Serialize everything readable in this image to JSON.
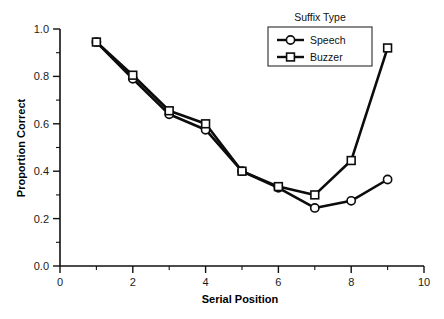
{
  "chart_data": {
    "type": "line",
    "title": "",
    "xlabel": "Serial Position",
    "ylabel": "Proportion Correct",
    "xlim": [
      0,
      10
    ],
    "ylim": [
      0,
      1.0
    ],
    "grid": false,
    "legend_title": "Suffix Type",
    "legend_position": "top-right",
    "x": [
      1,
      2,
      3,
      4,
      5,
      6,
      7,
      8,
      9
    ],
    "xticks": [
      0,
      2,
      4,
      6,
      8,
      10
    ],
    "xtick_labels": [
      "0",
      "2",
      "4",
      "6",
      "8",
      "10"
    ],
    "xminor_ticks": [
      1,
      3,
      5,
      7,
      9
    ],
    "yticks": [
      0.0,
      0.2,
      0.4,
      0.6,
      0.8,
      1.0
    ],
    "ytick_labels": [
      "0.0",
      "0.2",
      "0.4",
      "0.6",
      "0.8",
      "1.0"
    ],
    "yminor_ticks": [
      0.1,
      0.3,
      0.5,
      0.7,
      0.9
    ],
    "series": [
      {
        "name": "Speech",
        "marker": "circle",
        "color": "#0c0c0c",
        "values": [
          0.945,
          0.79,
          0.64,
          0.575,
          0.4,
          0.33,
          0.245,
          0.275,
          0.365
        ]
      },
      {
        "name": "Buzzer",
        "marker": "square",
        "color": "#0c0c0c",
        "values": [
          0.945,
          0.805,
          0.655,
          0.6,
          0.4,
          0.335,
          0.3,
          0.445,
          0.92
        ]
      }
    ]
  },
  "legend": {
    "title": "Suffix Type",
    "entries": [
      {
        "label": "Speech",
        "marker": "circle"
      },
      {
        "label": "Buzzer",
        "marker": "square"
      }
    ]
  },
  "axes": {
    "x_title": "Serial Position",
    "y_title": "Proportion Correct"
  }
}
